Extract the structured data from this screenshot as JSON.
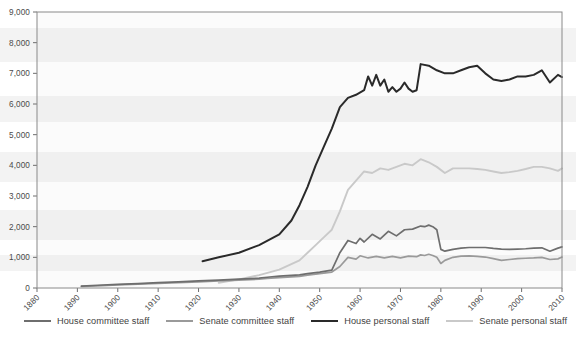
{
  "chart_data": {
    "type": "line",
    "title": "",
    "subtitle": "",
    "xlabel": "",
    "ylabel": "",
    "xlim": [
      1880,
      2010
    ],
    "ylim": [
      0,
      9000
    ],
    "grid": false,
    "legend_position": "bottom",
    "y_ticks": [
      "0",
      "1,000",
      "2,000",
      "3,000",
      "4,000",
      "5,000",
      "6,000",
      "7,000",
      "8,000",
      "9,000"
    ],
    "y_tick_values": [
      0,
      1000,
      2000,
      3000,
      4000,
      5000,
      6000,
      7000,
      8000,
      9000
    ],
    "x_ticks": [
      "1880",
      "1890",
      "1900",
      "1910",
      "1920",
      "1930",
      "1940",
      "1950",
      "1960",
      "1970",
      "1980",
      "1990",
      "2000",
      "2010"
    ],
    "x_tick_values": [
      1880,
      1890,
      1900,
      1910,
      1920,
      1930,
      1940,
      1950,
      1960,
      1970,
      1980,
      1990,
      2000,
      2010
    ],
    "series": [
      {
        "name": "House committee staff",
        "color": "#6e6e6e",
        "width": 1.7,
        "x": [
          1891,
          1895,
          1900,
          1905,
          1910,
          1915,
          1920,
          1925,
          1930,
          1935,
          1937,
          1940,
          1945,
          1947,
          1950,
          1953,
          1955,
          1957,
          1959,
          1960,
          1961,
          1963,
          1965,
          1967,
          1969,
          1971,
          1973,
          1975,
          1976,
          1977,
          1978,
          1979,
          1980,
          1981,
          1983,
          1985,
          1987,
          1989,
          1991,
          1993,
          1995,
          1997,
          1999,
          2001,
          2003,
          2005,
          2007,
          2009,
          2010
        ],
        "y": [
          62,
          90,
          120,
          145,
          175,
          200,
          230,
          260,
          290,
          320,
          350,
          390,
          430,
          470,
          520,
          580,
          1150,
          1550,
          1450,
          1620,
          1500,
          1750,
          1600,
          1850,
          1700,
          1900,
          1920,
          2020,
          2000,
          2050,
          2000,
          1900,
          1260,
          1200,
          1260,
          1300,
          1320,
          1320,
          1320,
          1290,
          1270,
          1260,
          1270,
          1280,
          1300,
          1310,
          1200,
          1300,
          1340
        ]
      },
      {
        "name": "Senate committee staff",
        "color": "#9a9a9a",
        "width": 1.7,
        "x": [
          1891,
          1895,
          1900,
          1905,
          1910,
          1915,
          1920,
          1925,
          1930,
          1935,
          1937,
          1940,
          1945,
          1947,
          1950,
          1953,
          1955,
          1957,
          1959,
          1960,
          1962,
          1964,
          1966,
          1968,
          1970,
          1972,
          1974,
          1975,
          1976,
          1977,
          1978,
          1979,
          1980,
          1981,
          1983,
          1985,
          1987,
          1989,
          1991,
          1993,
          1995,
          1997,
          1999,
          2001,
          2003,
          2005,
          2007,
          2009,
          2010
        ],
        "y": [
          50,
          72,
          100,
          125,
          150,
          175,
          200,
          230,
          255,
          285,
          310,
          340,
          380,
          420,
          470,
          520,
          700,
          1000,
          940,
          1050,
          980,
          1030,
          980,
          1030,
          980,
          1040,
          1020,
          1080,
          1060,
          1100,
          1060,
          1000,
          800,
          900,
          1000,
          1040,
          1050,
          1030,
          1010,
          960,
          900,
          930,
          960,
          970,
          980,
          1000,
          930,
          950,
          1010
        ]
      },
      {
        "name": "House personal staff",
        "color": "#2a2a2a",
        "width": 2.0,
        "x": [
          1921,
          1925,
          1930,
          1935,
          1940,
          1943,
          1945,
          1947,
          1949,
          1951,
          1953,
          1955,
          1957,
          1959,
          1961,
          1962,
          1963,
          1964,
          1965,
          1966,
          1967,
          1968,
          1969,
          1970,
          1971,
          1972,
          1973,
          1974,
          1975,
          1977,
          1979,
          1981,
          1983,
          1985,
          1987,
          1989,
          1991,
          1993,
          1995,
          1997,
          1999,
          2001,
          2003,
          2005,
          2007,
          2009,
          2010
        ],
        "y": [
          870,
          1000,
          1150,
          1400,
          1750,
          2200,
          2700,
          3300,
          4000,
          4600,
          5200,
          5900,
          6200,
          6300,
          6450,
          6900,
          6600,
          6950,
          6600,
          6800,
          6400,
          6550,
          6400,
          6500,
          6700,
          6500,
          6400,
          6450,
          7300,
          7250,
          7100,
          7000,
          7000,
          7100,
          7200,
          7250,
          7000,
          6800,
          6750,
          6800,
          6900,
          6900,
          6950,
          7100,
          6700,
          6950,
          6880
        ]
      },
      {
        "name": "Senate personal staff",
        "color": "#c9c9c9",
        "width": 1.9,
        "x": [
          1925,
          1930,
          1935,
          1940,
          1945,
          1947,
          1949,
          1951,
          1953,
          1955,
          1957,
          1959,
          1961,
          1963,
          1965,
          1967,
          1969,
          1971,
          1973,
          1975,
          1977,
          1979,
          1981,
          1983,
          1985,
          1987,
          1989,
          1991,
          1993,
          1995,
          1997,
          1999,
          2001,
          2003,
          2005,
          2007,
          2009,
          2010
        ],
        "y": [
          170,
          280,
          420,
          600,
          900,
          1150,
          1400,
          1650,
          1900,
          2500,
          3200,
          3500,
          3800,
          3750,
          3900,
          3850,
          3950,
          4050,
          4000,
          4200,
          4100,
          3950,
          3750,
          3900,
          3900,
          3900,
          3880,
          3850,
          3800,
          3750,
          3780,
          3820,
          3880,
          3950,
          3950,
          3900,
          3820,
          3900
        ]
      }
    ]
  },
  "legend": {
    "items": [
      {
        "label": "House committee staff",
        "color": "#6e6e6e",
        "thickness": "2.4px"
      },
      {
        "label": "Senate committee staff",
        "color": "#9a9a9a",
        "thickness": "2.2px"
      },
      {
        "label": "House personal staff",
        "color": "#2a2a2a",
        "thickness": "2.8px"
      },
      {
        "label": "Senate personal staff",
        "color": "#c9c9c9",
        "thickness": "2.2px"
      }
    ]
  },
  "plot": {
    "border_color": "#8a8a8a",
    "background": "#fbfbfb"
  }
}
